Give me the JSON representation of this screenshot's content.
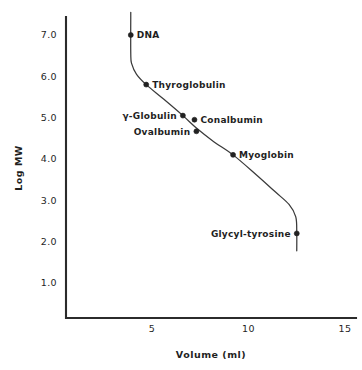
{
  "chart_data": {
    "type": "scatter",
    "title": "",
    "xlabel": "Volume (ml)",
    "ylabel": "Log MW",
    "xlim": [
      1.5,
      15.9
    ],
    "ylim": [
      0.15,
      7.6
    ],
    "xticks": [
      "5",
      "10",
      "15"
    ],
    "xtick_values": [
      5,
      10,
      15
    ],
    "yticks": [
      "7.0",
      "6.0",
      "5.0",
      "4.0",
      "3.0",
      "2.0",
      "1.0"
    ],
    "ytick_values": [
      7.0,
      6.0,
      5.0,
      4.0,
      3.0,
      2.0,
      1.0
    ],
    "grid": false,
    "legend": false,
    "points": [
      {
        "label": "DNA",
        "x": 3.9,
        "y": 7.0,
        "label_side": "right"
      },
      {
        "label": "Thyroglobulin",
        "x": 4.7,
        "y": 5.8,
        "label_side": "right"
      },
      {
        "label": "γ-Globulin",
        "x": 6.6,
        "y": 5.05,
        "label_side": "left"
      },
      {
        "label": "Conalbumin",
        "x": 7.2,
        "y": 4.95,
        "label_side": "right"
      },
      {
        "label": "Ovalbumin",
        "x": 7.3,
        "y": 4.67,
        "label_side": "left"
      },
      {
        "label": "Myoglobin",
        "x": 9.2,
        "y": 4.1,
        "label_side": "right"
      },
      {
        "label": "Glycyl-tyrosine",
        "x": 12.5,
        "y": 2.2,
        "label_side": "left"
      }
    ],
    "curve": [
      {
        "x": 3.9,
        "y": 7.55
      },
      {
        "x": 3.9,
        "y": 6.55
      },
      {
        "x": 3.95,
        "y": 6.3
      },
      {
        "x": 4.2,
        "y": 6.05
      },
      {
        "x": 4.7,
        "y": 5.8
      },
      {
        "x": 5.6,
        "y": 5.45
      },
      {
        "x": 6.6,
        "y": 5.05
      },
      {
        "x": 7.3,
        "y": 4.75
      },
      {
        "x": 8.2,
        "y": 4.42
      },
      {
        "x": 9.2,
        "y": 4.1
      },
      {
        "x": 10.4,
        "y": 3.62
      },
      {
        "x": 11.4,
        "y": 3.2
      },
      {
        "x": 12.1,
        "y": 2.9
      },
      {
        "x": 12.45,
        "y": 2.6
      },
      {
        "x": 12.5,
        "y": 2.2
      },
      {
        "x": 12.5,
        "y": 1.78
      }
    ],
    "colors": {
      "axis": "#2b2b2b",
      "curve": "#3a3a3a",
      "marker": "#222222",
      "text": "#1f1f1f",
      "background": "#ffffff"
    }
  }
}
